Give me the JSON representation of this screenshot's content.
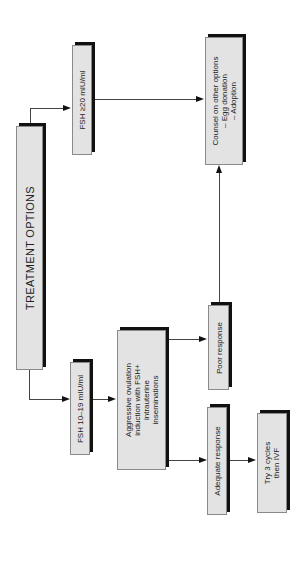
{
  "diagram": {
    "title": "TREATMENT OPTIONS",
    "nodes": {
      "fsh_high": "FSH  ≥20 mIU/ml",
      "fsh_mid": "FSH  10–19 mIU/ml",
      "aggressive": [
        "Aggressive ovulation",
        "induction with FSH+",
        "intrauterine",
        "inseminations"
      ],
      "counsel": [
        "Counsel on other options",
        "– Egg donation",
        "– Adoption"
      ],
      "poor": "Poor response",
      "adequate": "Adequate response",
      "try": [
        "Try 3 cycles",
        "then IVF"
      ]
    },
    "edges": [
      [
        "TREATMENT OPTIONS",
        "FSH ≥20 mIU/ml"
      ],
      [
        "TREATMENT OPTIONS",
        "FSH 10–19 mIU/ml"
      ],
      [
        "FSH ≥20 mIU/ml",
        "Counsel on other options"
      ],
      [
        "FSH 10–19 mIU/ml",
        "Aggressive ovulation induction"
      ],
      [
        "Aggressive ovulation induction",
        "Poor response"
      ],
      [
        "Aggressive ovulation induction",
        "Adequate response"
      ],
      [
        "Poor response",
        "Counsel on other options"
      ],
      [
        "Adequate response",
        "Try 3 cycles then IVF"
      ]
    ]
  }
}
